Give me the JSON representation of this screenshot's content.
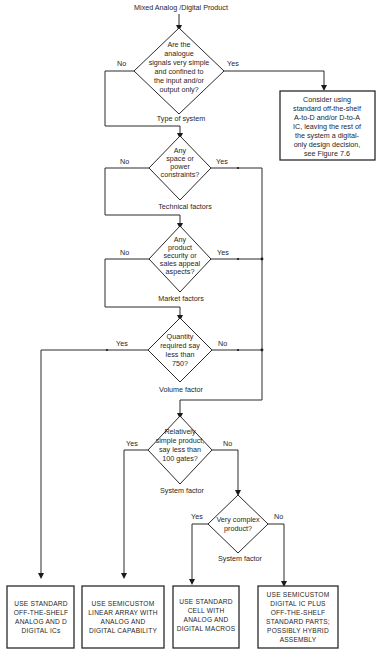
{
  "diagram": {
    "title": "Mixed Analog /Digital Product",
    "decisions": [
      {
        "id": "d1",
        "lines": [
          "Are the",
          "analogue",
          "signals very simple",
          "and confined to",
          "the input and/or",
          "output only?"
        ],
        "factor": "Type of system",
        "no_label": "No",
        "yes_label": "Yes"
      },
      {
        "id": "d2",
        "lines": [
          "Any",
          "space or",
          "power",
          "constraints?"
        ],
        "factor": "Technical factors",
        "no_label": "No",
        "yes_label": "Yes"
      },
      {
        "id": "d3",
        "lines": [
          "Any",
          "product",
          "security or",
          "sales appeal",
          "aspects?"
        ],
        "factor": "Market factors",
        "no_label": "No",
        "yes_label": "Yes"
      },
      {
        "id": "d4",
        "lines": [
          "Quantity",
          "required say",
          "less than",
          "750?"
        ],
        "factor": "Volume factor",
        "yes_label": "Yes",
        "no_label": "No"
      },
      {
        "id": "d5",
        "lines": [
          "Relatively",
          "simple product,",
          "say less than",
          "100 gates?"
        ],
        "factor": "System factor",
        "yes_label": "Yes",
        "no_label": "No"
      },
      {
        "id": "d6",
        "lines": [
          "Very complex",
          "product?"
        ],
        "factor": "System factor",
        "yes_label": "Yes",
        "no_label": "No"
      }
    ],
    "consider_box": {
      "lines": [
        "Consider using",
        "standard off-the-shelf",
        "A-to-D and/or D-to-A",
        "IC, leaving the rest of",
        "the system a digital-",
        "only design decision,",
        "see Figure 7.6"
      ]
    },
    "outcomes": [
      {
        "id": "o1",
        "lines": [
          "USE STANDARD",
          "OFF-THE-SHELF",
          "ANALOG AND D",
          "DIGITAL ICs"
        ]
      },
      {
        "id": "o2",
        "lines": [
          "USE SEMICUSTOM",
          "LINEAR ARRAY WITH",
          "ANALOG AND",
          "DIGITAL CAPABILITY"
        ]
      },
      {
        "id": "o3",
        "lines": [
          "USE STANDARD",
          "CELL WITH",
          "ANALOG AND",
          "DIGITAL MACROS"
        ]
      },
      {
        "id": "o4",
        "lines": [
          "USE SEMICUSTOM",
          "DIGITAL IC PLUS",
          "OFF-THE-SHELF",
          "STANDARD PARTS;",
          "POSSIBLY HYBRID",
          "ASSEMBLY"
        ]
      }
    ]
  }
}
